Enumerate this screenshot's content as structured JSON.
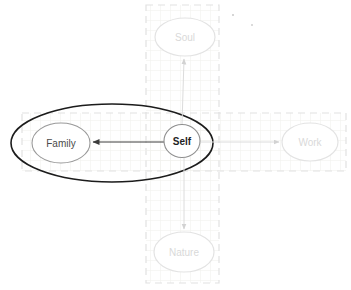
{
  "nodes": {
    "soul": {
      "label": "Soul",
      "state": "inactive"
    },
    "work": {
      "label": "Work",
      "state": "inactive"
    },
    "nature": {
      "label": "Nature",
      "state": "inactive"
    },
    "family": {
      "label": "Family",
      "state": "active"
    },
    "self": {
      "label": "Self",
      "state": "focus"
    }
  },
  "edges": [
    {
      "from": "self",
      "to": "family",
      "style": "solid-dark-arrow"
    },
    {
      "from": "self",
      "to": "soul",
      "style": "solid-light-arrow"
    },
    {
      "from": "self",
      "to": "work",
      "style": "solid-light-arrow"
    },
    {
      "from": "self",
      "to": "nature",
      "style": "solid-light-arrow"
    }
  ],
  "colors": {
    "background": "#ffffff",
    "emphasis_outline": "#1c1c1c",
    "self_node_border": "#8f8f8f",
    "family_node_border": "#9a9a9a",
    "inactive_node_border": "#e3e3e3",
    "inactive_text": "#d9d9d9",
    "dark_arrow": "#3c3c3c",
    "light_arrow": "#dcdcdc",
    "dashed_region_border": "#e2e2e2",
    "grid_line": "#f0f0ec"
  }
}
